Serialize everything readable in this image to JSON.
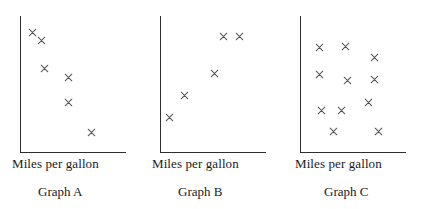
{
  "figure": {
    "marker_glyph": "×",
    "marker_color": "#555555",
    "axis_color": "#2e2e2e",
    "background": "#ffffff"
  },
  "chart_data": [
    {
      "type": "scatter",
      "title": "Graph A",
      "xlabel": "Miles per gallon",
      "ylabel": "",
      "grid": false,
      "legend": null,
      "xlim": [
        0,
        100
      ],
      "ylim": [
        0,
        100
      ],
      "relationship": "negative",
      "points": [
        {
          "x": 12,
          "y": 88
        },
        {
          "x": 20,
          "y": 82
        },
        {
          "x": 23,
          "y": 62
        },
        {
          "x": 46,
          "y": 55
        },
        {
          "x": 46,
          "y": 37
        },
        {
          "x": 67,
          "y": 15
        }
      ]
    },
    {
      "type": "scatter",
      "title": "Graph B",
      "xlabel": "Miles per gallon",
      "ylabel": "",
      "grid": false,
      "legend": null,
      "xlim": [
        0,
        100
      ],
      "ylim": [
        0,
        100
      ],
      "relationship": "positive",
      "points": [
        {
          "x": 9,
          "y": 26
        },
        {
          "x": 23,
          "y": 42
        },
        {
          "x": 51,
          "y": 58
        },
        {
          "x": 60,
          "y": 85
        },
        {
          "x": 75,
          "y": 85
        }
      ]
    },
    {
      "type": "scatter",
      "title": "Graph C",
      "xlabel": "Miles per gallon",
      "ylabel": "",
      "grid": false,
      "legend": null,
      "xlim": [
        0,
        100
      ],
      "ylim": [
        0,
        100
      ],
      "relationship": "none",
      "points": [
        {
          "x": 18,
          "y": 77
        },
        {
          "x": 43,
          "y": 78
        },
        {
          "x": 70,
          "y": 70
        },
        {
          "x": 18,
          "y": 57
        },
        {
          "x": 45,
          "y": 53
        },
        {
          "x": 70,
          "y": 54
        },
        {
          "x": 65,
          "y": 37
        },
        {
          "x": 20,
          "y": 31
        },
        {
          "x": 39,
          "y": 31
        },
        {
          "x": 32,
          "y": 16
        },
        {
          "x": 74,
          "y": 16
        }
      ]
    }
  ]
}
